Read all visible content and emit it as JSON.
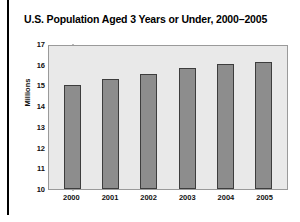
{
  "chart_data": {
    "type": "bar",
    "title": "U.S. Population Aged 3 Years or Under, 2000–2005",
    "xlabel": "",
    "ylabel": "Millions",
    "categories": [
      "2000",
      "2001",
      "2002",
      "2003",
      "2004",
      "2005"
    ],
    "values": [
      15.1,
      15.4,
      15.65,
      15.9,
      16.1,
      16.2
    ],
    "ylim": [
      10,
      17
    ],
    "ytick_labels": [
      "17",
      "16",
      "15",
      "14",
      "13",
      "12",
      "11",
      "10"
    ],
    "ytick_values": [
      17,
      16,
      15,
      14,
      13,
      12,
      11,
      10
    ],
    "grid": false,
    "legend": "none",
    "series": [
      {
        "name": "U.S. population aged 3 years or under",
        "values": [
          15.1,
          15.4,
          15.65,
          15.9,
          16.1,
          16.2
        ]
      }
    ],
    "colors": {
      "bar_fill": "#8d8d8d",
      "bar_border": "#3d3d3d",
      "plot_background": "#e9e9e9",
      "plot_border": "#9a9a9a",
      "text": "#111111",
      "rule": "#000000"
    }
  }
}
